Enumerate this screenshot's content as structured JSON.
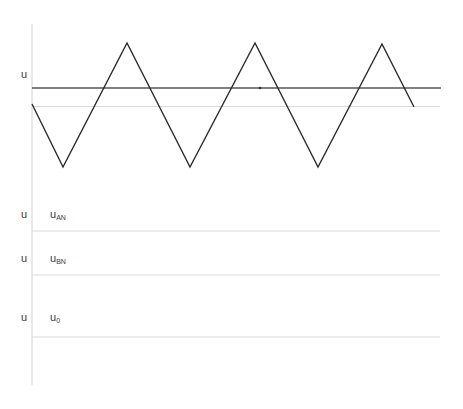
{
  "diagram": {
    "type": "pwm-waveform-sketch",
    "axis": {
      "x": 32,
      "y_top": 24,
      "y_bottom": 385,
      "color": "#d9d9d9"
    },
    "panels": [
      {
        "id": "carrier-panel",
        "axis_label": "u",
        "signal_label": "",
        "baseline_y": 106
      },
      {
        "id": "uan-panel",
        "axis_label": "u",
        "signal_label": "u",
        "signal_sub": "AN",
        "baseline_y": 231
      },
      {
        "id": "ubn-panel",
        "axis_label": "u",
        "signal_label": "u",
        "signal_sub": "BN",
        "baseline_y": 275
      },
      {
        "id": "u0-panel",
        "axis_label": "u",
        "signal_label": "u",
        "signal_sub": "0",
        "baseline_y": 337
      }
    ],
    "triangle_carrier": {
      "color": "#2b2b2b",
      "points": [
        [
          32,
          104
        ],
        [
          63,
          167
        ],
        [
          127,
          43
        ],
        [
          190,
          167
        ],
        [
          255,
          43
        ],
        [
          318,
          167
        ],
        [
          382,
          44
        ],
        [
          414,
          107
        ]
      ]
    },
    "reference_line": {
      "color": "#555555",
      "x1": 32,
      "x2": 441,
      "y": 88
    },
    "marker_dot": {
      "x": 260,
      "y": 88
    },
    "line_end_x": 440,
    "colors": {
      "grid": "#d9d9d9",
      "wave": "#2b2b2b",
      "reference": "#555555",
      "text": "#3a3a3a"
    }
  },
  "labels": {
    "carrier_axis": "u",
    "uan_axis": "u",
    "uan_signal": "u",
    "uan_sub": "AN",
    "ubn_axis": "u",
    "ubn_signal": "u",
    "ubn_sub": "BN",
    "u0_axis": "u",
    "u0_signal": "u",
    "u0_sub": "0"
  }
}
